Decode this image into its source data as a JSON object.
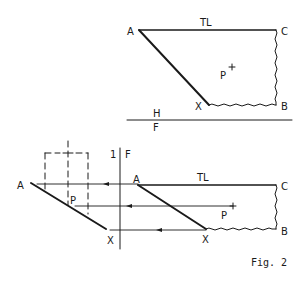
{
  "figure": {
    "caption": "Fig. 2",
    "ink_color": "#1a1a1a",
    "background": "#ffffff"
  },
  "top_view": {
    "vertices": {
      "A": "A",
      "C": "C",
      "B": "B",
      "X": "X"
    },
    "edge_label": "TL",
    "point_label": "P",
    "point_marker": "+"
  },
  "fold_line_hf": {
    "upper_label": "H",
    "lower_label": "F"
  },
  "fold_line_f1": {
    "left_label": "1",
    "right_label": "F"
  },
  "front_view": {
    "vertices": {
      "A": "A",
      "C": "C",
      "B": "B",
      "X": "X"
    },
    "edge_label": "TL",
    "point_label": "P",
    "point_marker": "+"
  },
  "auxiliary_view": {
    "vertices": {
      "A": "A",
      "X": "X"
    },
    "point_label": "P"
  }
}
